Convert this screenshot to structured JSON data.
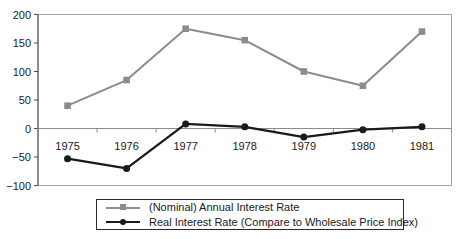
{
  "chart_data": {
    "type": "line",
    "categories": [
      "1975",
      "1976",
      "1977",
      "1978",
      "1979",
      "1980",
      "1981"
    ],
    "series": [
      {
        "name": "(Nominal) Annual Interest Rate",
        "values": [
          40,
          85,
          175,
          155,
          100,
          75,
          170
        ],
        "color": "#8c8c8c",
        "marker": "square",
        "line_width": 2
      },
      {
        "name": "Real Interest Rate (Compare to Wholesale Price Index)",
        "values": [
          -53,
          -70,
          8,
          3,
          -15,
          -2,
          3
        ],
        "color": "#1a1a1a",
        "marker": "circle",
        "line_width": 2.3
      }
    ],
    "title": "",
    "xlabel": "",
    "ylabel": "",
    "ylim": [
      -100,
      200
    ],
    "yticks": [
      200,
      150,
      100,
      50,
      0,
      -50,
      -100
    ],
    "grid": false,
    "legend_position": "bottom",
    "colors": {
      "axis": "#4d4d4d",
      "plot_border": "#a3a3a3",
      "zero_line": "#8c8c8c",
      "text": "#1a1a1a",
      "background": "#ffffff",
      "legend_border": "#2b2b2b"
    }
  }
}
